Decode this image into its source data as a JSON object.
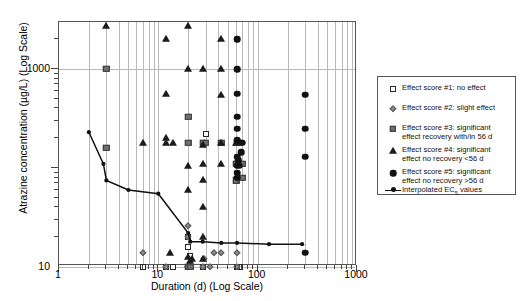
{
  "chart_data": {
    "type": "scatter",
    "title": "",
    "xlabel": "Duration (d) (Log Scale)",
    "ylabel": "Atrazine concentration (µg/L) (Log Scale)",
    "xscale": "log",
    "yscale": "log",
    "xlim": [
      1,
      1000
    ],
    "ylim": [
      0.1,
      3000
    ],
    "xticks": [
      "1",
      "10",
      "100",
      "1000"
    ],
    "yticks": [
      "1000",
      "10",
      "0.1"
    ],
    "grid": "minor vertical gridlines and major horizontal gridlines",
    "legend_position": "right",
    "series": [
      {
        "name": "Effect score #1: no effect",
        "marker": "open-square",
        "points": [
          [
            7,
            5.0
          ],
          [
            7,
            0.5
          ],
          [
            12,
            5.0
          ],
          [
            14,
            3.0
          ],
          [
            20,
            20.0
          ],
          [
            20,
            9.0
          ],
          [
            20,
            16.0
          ],
          [
            20,
            1.5
          ],
          [
            21,
            1.55
          ],
          [
            28,
            3.4
          ],
          [
            28,
            2.3
          ],
          [
            30,
            220.0
          ],
          [
            62,
            5.0
          ],
          [
            66,
            5.0
          ],
          [
            62,
            0.5
          ],
          [
            21,
            13.0
          ]
        ]
      },
      {
        "name": "Effect score #2: slight effect",
        "marker": "diamond",
        "points": [
          [
            7,
            14.0
          ],
          [
            12,
            2.3
          ],
          [
            20,
            1.3
          ],
          [
            20,
            9.5
          ],
          [
            20,
            20.0
          ],
          [
            20,
            26.0
          ],
          [
            28,
            9.6
          ],
          [
            29,
            12.0
          ],
          [
            33,
            5.0
          ],
          [
            36,
            14.0
          ],
          [
            43,
            14.0
          ],
          [
            62,
            9.6
          ],
          [
            62,
            14.0
          ],
          [
            20,
            1.35
          ]
        ]
      },
      {
        "name": "Effect score #3: significant effect recovery with/in 56 d",
        "marker": "filled-square",
        "points": [
          [
            3,
            1000.0
          ],
          [
            3,
            160.0
          ],
          [
            20,
            330.0
          ],
          [
            20,
            180.0
          ],
          [
            20,
            9.8
          ],
          [
            21,
            9.8
          ],
          [
            28,
            180.0
          ],
          [
            30,
            180.0
          ],
          [
            43,
            180.0
          ],
          [
            60,
            110.0
          ],
          [
            62,
            180.0
          ],
          [
            64,
            110.0
          ],
          [
            66,
            180.0
          ],
          [
            70,
            110.0
          ],
          [
            70,
            80.0
          ],
          [
            62,
            75.0
          ],
          [
            60,
            75.0
          ]
        ]
      },
      {
        "name": "Effect score #4: significant effect no recovery <56 d",
        "marker": "triangle",
        "points": [
          [
            3,
            2700.0
          ],
          [
            7,
            180.0
          ],
          [
            12,
            2000.0
          ],
          [
            12,
            560.0
          ],
          [
            12,
            200.0
          ],
          [
            12,
            180.0
          ],
          [
            13,
            14.0
          ],
          [
            14,
            180.0
          ],
          [
            20,
            2700.0
          ],
          [
            20,
            1000.0
          ],
          [
            20,
            105.0
          ],
          [
            20,
            60.0
          ],
          [
            20,
            12.5
          ],
          [
            21,
            11.5
          ],
          [
            22,
            12.0
          ],
          [
            28,
            1000.0
          ],
          [
            28,
            170.0
          ],
          [
            28,
            110.0
          ],
          [
            28,
            75.0
          ],
          [
            28,
            40.0
          ],
          [
            28,
            20.0
          ],
          [
            28,
            12.0
          ],
          [
            43,
            2000.0
          ],
          [
            43,
            1000.0
          ],
          [
            43,
            550.0
          ],
          [
            43,
            180.0
          ],
          [
            43,
            110.0
          ],
          [
            60,
            180.0
          ]
        ]
      },
      {
        "name": "Effect score #5: significant effect no recovery >56 d",
        "marker": "circle",
        "points": [
          [
            62,
            2000.0
          ],
          [
            62,
            1000.0
          ],
          [
            62,
            560.0
          ],
          [
            62,
            330.0
          ],
          [
            62,
            250.0
          ],
          [
            62,
            190.0
          ],
          [
            62,
            130.0
          ],
          [
            62,
            105.0
          ],
          [
            62,
            90.0
          ],
          [
            62,
            80.0
          ],
          [
            64,
            120.0
          ],
          [
            66,
            105.0
          ],
          [
            68,
            145.0
          ],
          [
            70,
            180.0
          ],
          [
            300,
            550.0
          ],
          [
            300,
            250.0
          ],
          [
            300,
            130.0
          ],
          [
            300,
            14.0
          ]
        ]
      }
    ],
    "line_series": {
      "name": "Interpolated EC5 values",
      "marker": "small-circle-line",
      "points": [
        [
          2.0,
          230.0
        ],
        [
          2.8,
          110.0
        ],
        [
          3.0,
          75.0
        ],
        [
          5.0,
          60.0
        ],
        [
          10.0,
          55.0
        ],
        [
          20.0,
          22.0
        ],
        [
          21.0,
          18.0
        ],
        [
          28.0,
          18.0
        ],
        [
          43.0,
          17.5
        ],
        [
          62.0,
          17.5
        ],
        [
          130.0,
          17.0
        ],
        [
          280.0,
          17.0
        ]
      ]
    }
  },
  "legend": {
    "items": [
      {
        "marker": "open-square",
        "line1": "Effect score #1: no effect",
        "line2": ""
      },
      {
        "marker": "diamond",
        "line1": "Effect score #2: slight effect",
        "line2": ""
      },
      {
        "marker": "filled-square",
        "line1": "Effect score #3: significant",
        "line2": "effect recovery with/in 56 d"
      },
      {
        "marker": "triangle",
        "line1": "Effect score #4: significant",
        "line2": "effect no recovery <56 d"
      },
      {
        "marker": "circle",
        "line1": "Effect score #5: significant",
        "line2": "effect no recovery >56 d"
      },
      {
        "marker": "line-dot",
        "line1": "Interpolated EC",
        "line1sub": "5",
        "line1tail": " values",
        "line2": ""
      }
    ]
  },
  "axes": {
    "x_title": "Duration (d) (Log Scale)",
    "y_title": "Atrazine concentration (µg/L) (Log Scale)",
    "x_tick_labels": [
      "1",
      "10",
      "100",
      "1000"
    ],
    "y_tick_labels": [
      "1000",
      "10",
      "0.1"
    ]
  },
  "colors": {
    "axis": "#555555",
    "grid": "#b9b9b9",
    "marker_dark": "#111111",
    "marker_gray": "#6f6f6f",
    "marker_light_gray": "#8a8a8a",
    "background": "#ffffff"
  }
}
